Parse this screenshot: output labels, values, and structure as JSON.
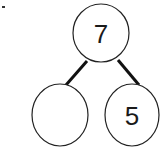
{
  "diagram": {
    "type": "number-bond",
    "whole": {
      "value": "7"
    },
    "parts": [
      {
        "value": ""
      },
      {
        "value": "5"
      }
    ]
  }
}
